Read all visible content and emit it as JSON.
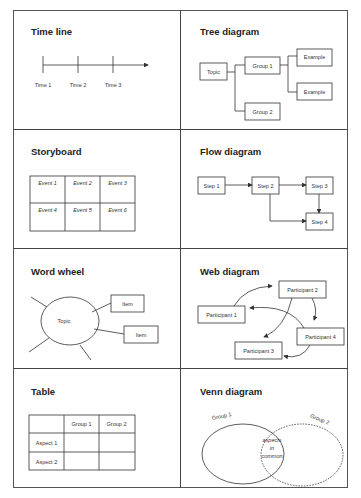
{
  "panels": {
    "timeline": {
      "title": "Time line",
      "labels": [
        "Time 1",
        "Time 2",
        "Time 3"
      ]
    },
    "tree": {
      "title": "Tree diagram",
      "topic": "Topic",
      "group1": "Group 1",
      "group2": "Group 2",
      "example1": "Example",
      "example2": "Example"
    },
    "storyboard": {
      "title": "Storyboard",
      "events": [
        "Event 1",
        "Event 2",
        "Event 3",
        "Event 4",
        "Event 5",
        "Event 6"
      ]
    },
    "flow": {
      "title": "Flow diagram",
      "steps": [
        "Step 1",
        "Step 2",
        "Step 3",
        "Step 4"
      ]
    },
    "wordwheel": {
      "title": "Word wheel",
      "topic": "Topic",
      "items": [
        "Item",
        "Item"
      ]
    },
    "web": {
      "title": "Web diagram",
      "participants": [
        "Participant 1",
        "Participant 2",
        "Participant 3",
        "Participant 4"
      ]
    },
    "table": {
      "title": "Table",
      "columns": [
        "",
        "Group 1",
        "Group 2"
      ],
      "rows": [
        "Aspect 1",
        "Aspect 2"
      ]
    },
    "venn": {
      "title": "Venn diagram",
      "group1": "Group 1",
      "group2": "Group 2",
      "overlap": [
        "aspects",
        "in",
        "common"
      ]
    }
  }
}
